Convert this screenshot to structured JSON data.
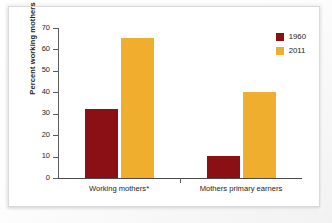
{
  "chart_data": {
    "type": "bar",
    "title": "",
    "xlabel": "",
    "ylabel": "Percent working mothers",
    "ylim": [
      0,
      70
    ],
    "yticks": [
      0,
      10,
      20,
      30,
      40,
      50,
      60,
      70
    ],
    "ytick_labels": [
      "0",
      "10",
      "20",
      "30",
      "40",
      "50",
      "60",
      "70"
    ],
    "grid": false,
    "legend_position": "top-right",
    "categories": [
      "Working mothers*",
      "Mothers primary earners"
    ],
    "series": [
      {
        "name": "1960",
        "color": "#8B1016",
        "values": [
          32,
          10.5
        ]
      },
      {
        "name": "2011",
        "color": "#EFAE2E",
        "values": [
          65.5,
          40
        ]
      }
    ]
  },
  "legend": {
    "items": [
      {
        "label": "1960",
        "color": "#8B1016"
      },
      {
        "label": "2011",
        "color": "#EFAE2E"
      }
    ]
  }
}
